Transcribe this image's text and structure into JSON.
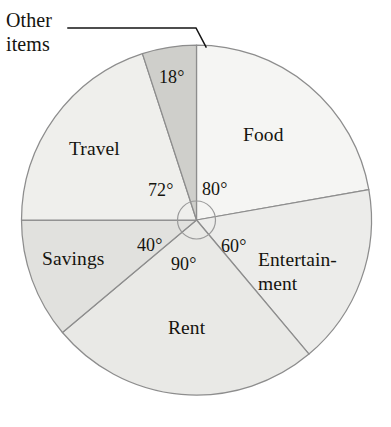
{
  "chart_data": {
    "type": "pie",
    "title": "",
    "xlabel": "",
    "ylabel": "",
    "units": "degrees",
    "total_degrees": 360,
    "start_angle_deg": 0,
    "direction": "clockwise",
    "legend": "none (labels placed on slices)",
    "grid": false,
    "categories": [
      "Food",
      "Entertainment",
      "Rent",
      "Savings",
      "Travel",
      "Other items"
    ],
    "values": [
      80,
      60,
      90,
      40,
      72,
      18
    ],
    "labels": [
      "80°",
      "60°",
      "90°",
      "40°",
      "72°",
      "18°"
    ],
    "slices": [
      {
        "name": "Food",
        "label": "Food",
        "angle_deg": 80,
        "angle_label": "80°",
        "start_deg": 0,
        "end_deg": 80,
        "color": "#f5f5f3",
        "percent": 22.2
      },
      {
        "name": "Entertainment",
        "label": "Entertain-\nment",
        "label_line1": "Entertain-",
        "label_line2": "ment",
        "angle_deg": 60,
        "angle_label": "60°",
        "start_deg": 80,
        "end_deg": 140,
        "color": "#ececea",
        "percent": 16.7
      },
      {
        "name": "Rent",
        "label": "Rent",
        "angle_deg": 90,
        "angle_label": "90°",
        "start_deg": 140,
        "end_deg": 230,
        "color": "#e9e9e6",
        "percent": 25.0
      },
      {
        "name": "Savings",
        "label": "Savings",
        "angle_deg": 40,
        "angle_label": "40°",
        "start_deg": 230,
        "end_deg": 270,
        "color": "#e1e1de",
        "percent": 11.1
      },
      {
        "name": "Travel",
        "label": "Travel",
        "angle_deg": 72,
        "angle_label": "72°",
        "start_deg": 270,
        "end_deg": 342,
        "color": "#efefec",
        "percent": 20.0
      },
      {
        "name": "Other items",
        "label": "Other items",
        "label_line1": "Other",
        "label_line2": "items",
        "angle_deg": 18,
        "angle_label": "18°",
        "start_deg": 342,
        "end_deg": 360,
        "color": "#cfcfcb",
        "percent": 5.0,
        "callout": true
      }
    ],
    "geometry": {
      "center_x": 196.5,
      "center_y": 220,
      "radius": 175,
      "center_circle_radius": 19
    },
    "colors": {
      "outline": "#8d8d8d",
      "text": "#15140f",
      "background": "#ffffff",
      "leader": "#141414"
    }
  }
}
